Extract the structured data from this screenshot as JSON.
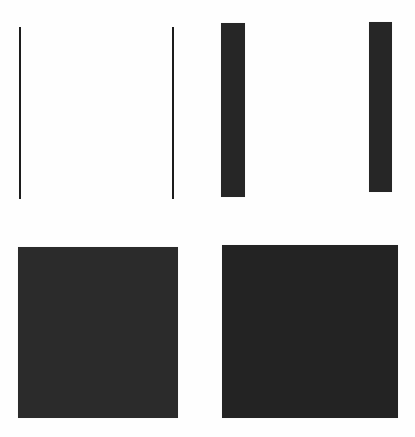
{
  "figure": {
    "background_color": "#fefefe",
    "width": 415,
    "height": 437,
    "layout": "2x2 quadrant grid of abstract rectangles"
  },
  "quadrants": [
    {
      "id": "top-left",
      "label": "Two thin vertical hairlines"
    },
    {
      "id": "top-right",
      "label": "Two narrow vertical bars"
    },
    {
      "id": "bottom-left",
      "label": "Large filled square"
    },
    {
      "id": "bottom-right",
      "label": "Large filled square"
    }
  ],
  "shapes": [
    {
      "name": "hairline-left",
      "kind": "line",
      "quadrant": "top-left",
      "color": "#1c1c1c",
      "x": 19,
      "y": 27,
      "width": 2,
      "height": 172
    },
    {
      "name": "hairline-right",
      "kind": "line",
      "quadrant": "top-left",
      "color": "#1c1c1c",
      "x": 172,
      "y": 27,
      "width": 2,
      "height": 172
    },
    {
      "name": "bar-left",
      "kind": "bar",
      "quadrant": "top-right",
      "color": "#262626",
      "x": 221,
      "y": 23,
      "width": 24,
      "height": 174
    },
    {
      "name": "bar-right",
      "kind": "bar",
      "quadrant": "top-right",
      "color": "#262626",
      "x": 369,
      "y": 22,
      "width": 23,
      "height": 170
    },
    {
      "name": "square-left",
      "kind": "square",
      "quadrant": "bottom-left",
      "color": "#2b2b2b",
      "x": 18,
      "y": 247,
      "width": 160,
      "height": 171
    },
    {
      "name": "square-right",
      "kind": "square",
      "quadrant": "bottom-right",
      "color": "#232323",
      "x": 222,
      "y": 245,
      "width": 176,
      "height": 173
    }
  ],
  "colors": {
    "ink_line": "#1c1c1c",
    "ink_bar": "#262626",
    "ink_square_left": "#2b2b2b",
    "ink_square_right": "#232323",
    "paper": "#fefefe"
  }
}
